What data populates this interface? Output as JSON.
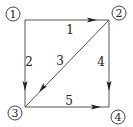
{
  "diagram": {
    "type": "directed-graph",
    "colors": {
      "line": "#555555",
      "text": "#222222",
      "background": "#ffffff"
    },
    "nodes": [
      {
        "id": "1",
        "label": "1",
        "x": 13,
        "y": 14
      },
      {
        "id": "2",
        "label": "2",
        "x": 119,
        "y": 13
      },
      {
        "id": "3",
        "label": "3",
        "x": 15,
        "y": 113
      },
      {
        "id": "4",
        "label": "4",
        "x": 118,
        "y": 117
      }
    ],
    "edges": [
      {
        "id": "1",
        "label": "1",
        "from": "1",
        "to": "2"
      },
      {
        "id": "2",
        "label": "2",
        "from": "1",
        "to": "3"
      },
      {
        "id": "3",
        "label": "3",
        "from": "2",
        "to": "3"
      },
      {
        "id": "4",
        "label": "4",
        "from": "2",
        "to": "4"
      },
      {
        "id": "5",
        "label": "5",
        "from": "3",
        "to": "4"
      }
    ]
  }
}
